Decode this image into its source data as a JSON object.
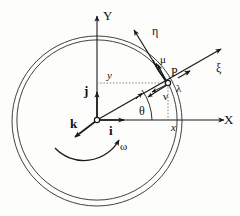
{
  "figure": {
    "type": "vector-kinematics-diagram",
    "background_color": "#fdfdfc",
    "stroke_color": "#1a1a1a",
    "labels": {
      "axis_x": "X",
      "axis_y": "Y",
      "basis_i": "i",
      "basis_j": "j",
      "basis_k": "k",
      "coord_x": "x",
      "coord_y": "y",
      "point_p": "P",
      "angle_theta": "θ",
      "omega": "ω",
      "xi": "ξ",
      "eta": "η",
      "mu": "μ",
      "nu": "ν",
      "lambda": "λ"
    },
    "geometry": {
      "origin": {
        "x": 97,
        "y": 120
      },
      "point_p": {
        "x": 168,
        "y": 83
      },
      "outer_circle": {
        "cx": 97,
        "cy": 121,
        "r": 85
      },
      "inner_circle": {
        "cx": 97,
        "cy": 120,
        "r": 80
      }
    }
  }
}
